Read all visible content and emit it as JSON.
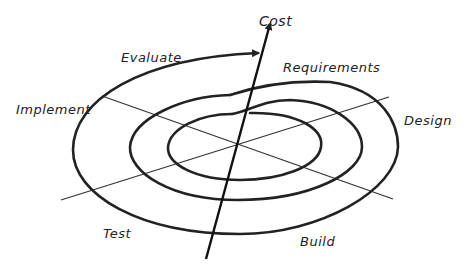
{
  "diagram": {
    "type": "spiral-model",
    "axis_label": "Cost",
    "phases": [
      {
        "id": "requirements",
        "label": "Requirements"
      },
      {
        "id": "design",
        "label": "Design"
      },
      {
        "id": "build",
        "label": "Build"
      },
      {
        "id": "test",
        "label": "Test"
      },
      {
        "id": "implement",
        "label": "Implement"
      },
      {
        "id": "evaluate",
        "label": "Evaluate"
      }
    ],
    "rings": 3,
    "stroke_color": "#222222",
    "background": "#ffffff"
  }
}
